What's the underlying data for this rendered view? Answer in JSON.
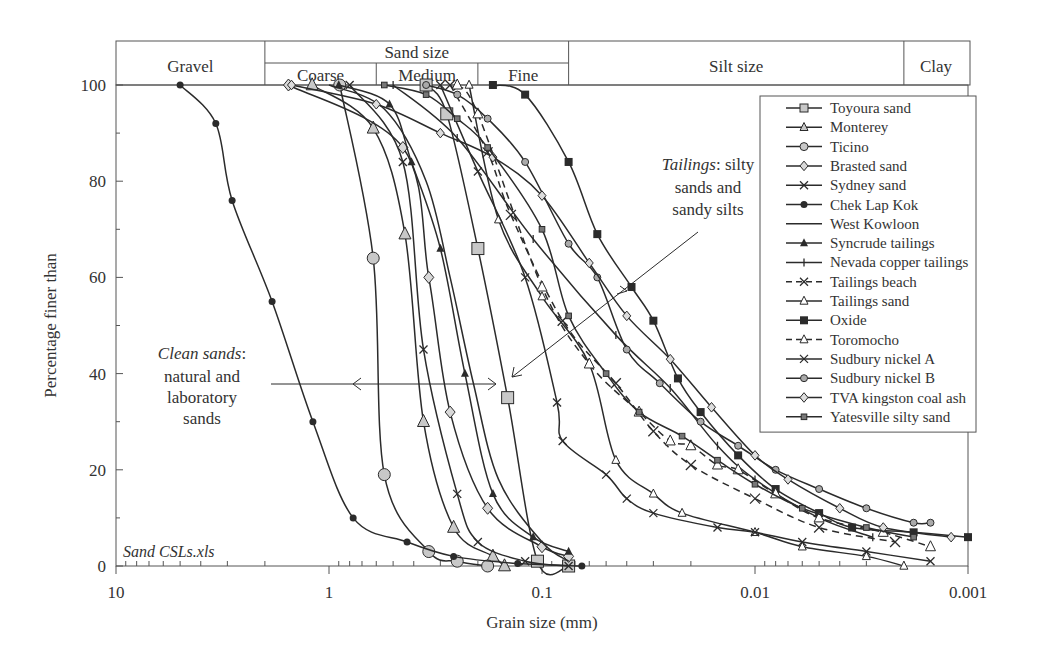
{
  "chart_data": {
    "type": "line",
    "title": "",
    "xlabel": "Grain size (mm)",
    "ylabel": "Percentage finer than",
    "xscale": "log",
    "xlim": [
      10,
      0.001
    ],
    "ylim": [
      0,
      100
    ],
    "x_ticks": [
      "10",
      "1",
      "0.1",
      "0.01",
      "0.001"
    ],
    "x_tick_values": [
      10,
      1,
      0.1,
      0.01,
      0.001
    ],
    "y_ticks": [
      "0",
      "20",
      "40",
      "60",
      "80",
      "100"
    ],
    "y_tick_values": [
      0,
      20,
      40,
      60,
      80,
      100
    ],
    "grid": false,
    "legend_position": "upper right",
    "size_classes": {
      "top_row": [
        {
          "label": "Gravel",
          "from": 10,
          "to": 2
        },
        {
          "label": "Sand size",
          "from": 2,
          "to": 0.075
        },
        {
          "label": "Silt size",
          "from": 0.075,
          "to": 0.002
        },
        {
          "label": "Clay",
          "from": 0.002,
          "to": 0.001
        }
      ],
      "sand_subclasses": [
        {
          "label": "Coarse",
          "from": 2,
          "to": 0.6
        },
        {
          "label": "Medium",
          "from": 0.6,
          "to": 0.2
        },
        {
          "label": "Fine",
          "from": 0.2,
          "to": 0.075
        }
      ]
    },
    "annotations": [
      {
        "italic": "Clean sands",
        "rest": ":",
        "lines": [
          "natural and",
          "laboratory",
          "sands"
        ]
      },
      {
        "italic": "Tailings",
        "rest": ": silty",
        "lines": [
          "sands and",
          "sandy silts"
        ]
      },
      {
        "text": "Sand CSLs.xls",
        "italic_all": true
      }
    ],
    "series": [
      {
        "name": "Toyoura sand",
        "marker": "square",
        "fill": "#c8c8c8",
        "dash": false,
        "size": 6,
        "points": [
          [
            0.35,
            100
          ],
          [
            0.28,
            94
          ],
          [
            0.2,
            66
          ],
          [
            0.145,
            35
          ],
          [
            0.105,
            1
          ],
          [
            0.075,
            0
          ]
        ]
      },
      {
        "name": "Monterey",
        "marker": "triangle",
        "fill": "#c8c8c8",
        "dash": false,
        "size": 6,
        "points": [
          [
            1.2,
            100
          ],
          [
            0.62,
            91
          ],
          [
            0.44,
            69
          ],
          [
            0.36,
            30
          ],
          [
            0.26,
            8
          ],
          [
            0.17,
            2
          ],
          [
            0.15,
            0
          ]
        ]
      },
      {
        "name": "Ticino",
        "marker": "circle",
        "fill": "#c8c8c8",
        "dash": false,
        "size": 6,
        "points": [
          [
            0.89,
            100
          ],
          [
            0.62,
            64
          ],
          [
            0.55,
            19
          ],
          [
            0.34,
            3
          ],
          [
            0.25,
            1
          ],
          [
            0.18,
            0
          ]
        ]
      },
      {
        "name": "Brasted sand",
        "marker": "diamond",
        "fill": "#d8d8d8",
        "dash": false,
        "size": 5,
        "points": [
          [
            1.55,
            100
          ],
          [
            0.45,
            87
          ],
          [
            0.34,
            60
          ],
          [
            0.27,
            32
          ],
          [
            0.18,
            12
          ],
          [
            0.1,
            4
          ],
          [
            0.075,
            2
          ]
        ]
      },
      {
        "name": "Sydney sand",
        "marker": "x",
        "fill": "#222",
        "dash": false,
        "size": 4,
        "points": [
          [
            0.8,
            100
          ],
          [
            0.45,
            84
          ],
          [
            0.36,
            45
          ],
          [
            0.25,
            15
          ],
          [
            0.2,
            5
          ],
          [
            0.12,
            1
          ],
          [
            0.075,
            0
          ]
        ]
      },
      {
        "name": "Chek Lap Kok",
        "marker": "dot",
        "fill": "#111",
        "dash": false,
        "size": 3.5,
        "points": [
          [
            5.0,
            100
          ],
          [
            3.4,
            92
          ],
          [
            2.85,
            76
          ],
          [
            1.85,
            55
          ],
          [
            1.19,
            30
          ],
          [
            0.77,
            10
          ],
          [
            0.43,
            5
          ],
          [
            0.26,
            2
          ],
          [
            0.13,
            0.5
          ],
          [
            0.065,
            0
          ]
        ]
      },
      {
        "name": "West Kowloon",
        "marker": "none",
        "fill": "#111",
        "dash": false,
        "size": 0,
        "points": [
          [
            1.0,
            100
          ],
          [
            0.55,
            95
          ],
          [
            0.35,
            80
          ],
          [
            0.27,
            60
          ],
          [
            0.21,
            38
          ],
          [
            0.16,
            18
          ],
          [
            0.1,
            5
          ],
          [
            0.075,
            1
          ]
        ]
      },
      {
        "name": "Syncrude tailings",
        "marker": "tri-filled",
        "fill": "#111",
        "dash": false,
        "size": 4,
        "points": [
          [
            0.9,
            100
          ],
          [
            0.52,
            96
          ],
          [
            0.41,
            84
          ],
          [
            0.3,
            66
          ],
          [
            0.23,
            40
          ],
          [
            0.17,
            15
          ],
          [
            0.11,
            6
          ],
          [
            0.075,
            3
          ]
        ]
      },
      {
        "name": "Nevada copper tailings",
        "marker": "plus",
        "fill": "#111",
        "dash": false,
        "size": 4,
        "points": [
          [
            0.5,
            100
          ],
          [
            0.25,
            89
          ],
          [
            0.11,
            68
          ],
          [
            0.045,
            48
          ],
          [
            0.025,
            37
          ],
          [
            0.015,
            25
          ],
          [
            0.01,
            18
          ],
          [
            0.005,
            10
          ],
          [
            0.0028,
            6
          ]
        ]
      },
      {
        "name": "Tailings beach",
        "marker": "x",
        "fill": "#111",
        "dash": true,
        "size": 5,
        "points": [
          [
            0.27,
            100
          ],
          [
            0.18,
            86
          ],
          [
            0.14,
            73
          ],
          [
            0.08,
            51
          ],
          [
            0.045,
            38
          ],
          [
            0.03,
            28
          ],
          [
            0.02,
            21
          ],
          [
            0.01,
            14
          ],
          [
            0.005,
            8
          ],
          [
            0.0022,
            5
          ]
        ]
      },
      {
        "name": "Tailings sand",
        "marker": "triangle",
        "fill": "#fff",
        "dash": false,
        "size": 4,
        "points": [
          [
            0.22,
            100
          ],
          [
            0.16,
            72
          ],
          [
            0.1,
            56
          ],
          [
            0.06,
            42
          ],
          [
            0.045,
            22
          ],
          [
            0.03,
            15
          ],
          [
            0.022,
            11
          ],
          [
            0.01,
            7
          ],
          [
            0.006,
            4
          ],
          [
            0.003,
            2
          ],
          [
            0.002,
            0
          ]
        ]
      },
      {
        "name": "Oxide",
        "marker": "square-filled",
        "fill": "#111",
        "dash": false,
        "size": 4,
        "points": [
          [
            0.17,
            100
          ],
          [
            0.12,
            98
          ],
          [
            0.075,
            84
          ],
          [
            0.055,
            69
          ],
          [
            0.038,
            58
          ],
          [
            0.03,
            51
          ],
          [
            0.023,
            39
          ],
          [
            0.018,
            32
          ],
          [
            0.012,
            23
          ],
          [
            0.008,
            16
          ],
          [
            0.005,
            11
          ],
          [
            0.0035,
            8
          ],
          [
            0.0018,
            7
          ],
          [
            0.001,
            6
          ]
        ]
      },
      {
        "name": "Toromocho",
        "marker": "triangle",
        "fill": "#fff",
        "dash": true,
        "size": 5,
        "points": [
          [
            0.25,
            100
          ],
          [
            0.2,
            94
          ],
          [
            0.1,
            58
          ],
          [
            0.06,
            42
          ],
          [
            0.035,
            32
          ],
          [
            0.025,
            26
          ],
          [
            0.02,
            25
          ],
          [
            0.015,
            21
          ],
          [
            0.012,
            20
          ],
          [
            0.008,
            15
          ],
          [
            0.005,
            10
          ],
          [
            0.0025,
            7
          ],
          [
            0.0015,
            4
          ]
        ]
      },
      {
        "name": "Sudbury nickel A",
        "marker": "x",
        "fill": "#111",
        "dash": false,
        "size": 4,
        "points": [
          [
            0.3,
            100
          ],
          [
            0.2,
            82
          ],
          [
            0.12,
            60
          ],
          [
            0.085,
            34
          ],
          [
            0.08,
            26
          ],
          [
            0.05,
            19
          ],
          [
            0.04,
            14
          ],
          [
            0.03,
            11
          ],
          [
            0.015,
            8
          ],
          [
            0.01,
            7
          ],
          [
            0.006,
            5
          ],
          [
            0.003,
            3
          ],
          [
            0.0015,
            1
          ]
        ]
      },
      {
        "name": "Sudbury nickel B",
        "marker": "circle-sm",
        "fill": "#aaa",
        "dash": false,
        "size": 3.5,
        "points": [
          [
            0.35,
            100
          ],
          [
            0.25,
            98
          ],
          [
            0.18,
            93
          ],
          [
            0.12,
            84
          ],
          [
            0.075,
            67
          ],
          [
            0.055,
            60
          ],
          [
            0.04,
            45
          ],
          [
            0.028,
            38
          ],
          [
            0.018,
            30
          ],
          [
            0.012,
            25
          ],
          [
            0.008,
            20
          ],
          [
            0.005,
            16
          ],
          [
            0.003,
            12
          ],
          [
            0.0018,
            9
          ],
          [
            0.0015,
            9
          ]
        ]
      },
      {
        "name": "TVA kingston coal ash",
        "marker": "diamond",
        "fill": "#ddd",
        "dash": false,
        "size": 4,
        "points": [
          [
            1.5,
            100
          ],
          [
            0.6,
            96
          ],
          [
            0.3,
            90
          ],
          [
            0.17,
            85
          ],
          [
            0.1,
            77
          ],
          [
            0.06,
            63
          ],
          [
            0.04,
            52
          ],
          [
            0.025,
            43
          ],
          [
            0.016,
            33
          ],
          [
            0.01,
            23
          ],
          [
            0.007,
            18
          ],
          [
            0.004,
            12
          ],
          [
            0.0025,
            8
          ],
          [
            0.0012,
            6
          ]
        ]
      },
      {
        "name": "Yatesville silty sand",
        "marker": "square-sm",
        "fill": "#777",
        "dash": false,
        "size": 3.5,
        "points": [
          [
            0.55,
            100
          ],
          [
            0.35,
            98
          ],
          [
            0.25,
            93
          ],
          [
            0.18,
            87
          ],
          [
            0.1,
            70
          ],
          [
            0.075,
            52
          ],
          [
            0.05,
            40
          ],
          [
            0.035,
            32
          ],
          [
            0.022,
            27
          ],
          [
            0.015,
            22
          ],
          [
            0.01,
            17
          ],
          [
            0.006,
            12
          ],
          [
            0.003,
            8
          ],
          [
            0.0018,
            6
          ]
        ]
      }
    ]
  }
}
